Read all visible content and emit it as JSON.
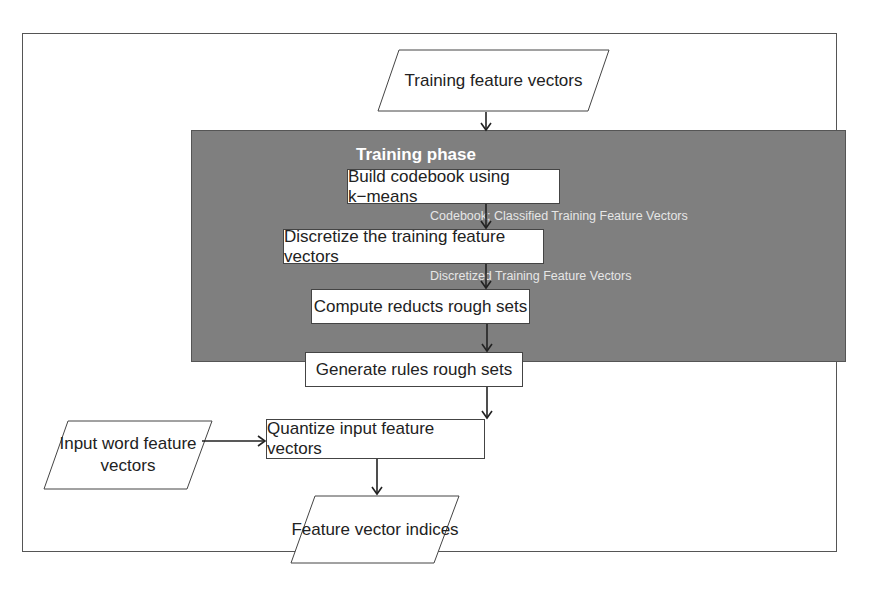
{
  "diagram": {
    "type": "flowchart",
    "inputs": {
      "training_vectors": "Training feature vectors",
      "input_word_vectors": "Input word feature vectors"
    },
    "training_phase": {
      "title": "Training phase",
      "steps": [
        "Build codebook using k−means",
        "Discretize the training feature vectors",
        "Compute reducts rough sets",
        "Generate rules rough sets"
      ],
      "edge_labels": [
        "Codebook; Classified Training Feature Vectors",
        "Discretized  Training Feature Vectors"
      ]
    },
    "quantize_step": "Quantize input feature vectors",
    "output": "Feature vector indices",
    "colors": {
      "phase_background": "#7f7f7f",
      "box_fill": "#ffffff",
      "stroke": "#333333",
      "annotation_text": "#e6e6e6"
    }
  }
}
